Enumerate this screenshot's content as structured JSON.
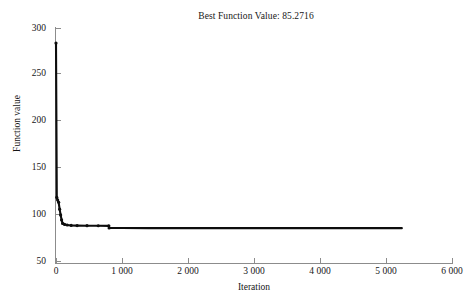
{
  "chart_data": {
    "type": "line",
    "title": "Best Function Value: 85.2716",
    "xlabel": "Iteration",
    "ylabel": "Function value",
    "xlim": [
      0,
      6000
    ],
    "ylim": [
      50,
      300
    ],
    "grid": false,
    "legend": null,
    "best_value": 85.2716,
    "xticks": [
      0,
      1000,
      2000,
      3000,
      4000,
      5000,
      6000
    ],
    "xticklabels": [
      "0",
      "1 000",
      "2 000",
      "3 000",
      "4 000",
      "5 000",
      "6 000"
    ],
    "yticks": [
      50,
      100,
      150,
      200,
      250,
      300
    ],
    "yticklabels": [
      "50",
      "100",
      "150",
      "200",
      "250",
      "300"
    ],
    "series": [
      {
        "name": "Best function value",
        "color": "#0d0d0d",
        "marker": "dot",
        "x": [
          0,
          12,
          25,
          40,
          55,
          70,
          85,
          100,
          130,
          170,
          230,
          320,
          470,
          640,
          800,
          805,
          1000,
          1400,
          1900,
          2500,
          3200,
          4000,
          4700,
          5240
        ],
        "y": [
          283.8,
          118.2,
          115.4,
          113.0,
          105.6,
          99.4,
          94.1,
          90.3,
          89.2,
          88.6,
          88.2,
          88.0,
          87.9,
          87.8,
          87.7,
          85.45,
          85.33,
          85.3,
          85.29,
          85.28,
          85.276,
          85.274,
          85.2723,
          85.2716
        ]
      }
    ]
  },
  "axes": {
    "title_text": "Best Function Value: 85.2716",
    "x_label_text": "Iteration",
    "y_label_text": "Function value"
  }
}
